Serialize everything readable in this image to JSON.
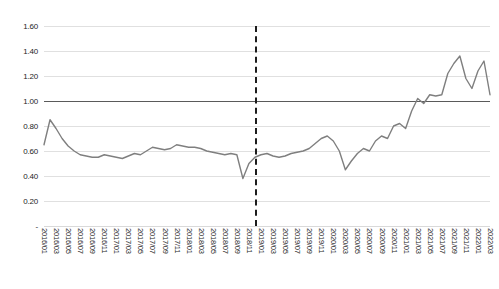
{
  "chart_data": {
    "type": "line",
    "title": "",
    "xlabel": "",
    "ylabel": "",
    "ylim": [
      0,
      1.6
    ],
    "ytick_labels": [
      "1.60",
      "1.40",
      "1.20",
      "1.00",
      "0.80",
      "0.60",
      "0.40",
      "0.20",
      "-"
    ],
    "ytick_values": [
      1.6,
      1.4,
      1.2,
      1.0,
      0.8,
      0.6,
      0.4,
      0.2,
      0.0
    ],
    "grid": "horizontal",
    "legend": "none",
    "reference_line": {
      "value": 1.0,
      "style": "solid",
      "color": "#5a5a5a"
    },
    "annotations": [
      {
        "type": "vertical-dashed-line",
        "x": "2018/12",
        "color": "#1c1c1c"
      }
    ],
    "tick_label_interval_months": 2,
    "tick_labels": [
      "2016/01",
      "2016/03",
      "2016/05",
      "2016/07",
      "2016/09",
      "2016/11",
      "2017/01",
      "2017/03",
      "2017/05",
      "2017/07",
      "2017/09",
      "2017/11",
      "2018/01",
      "2018/03",
      "2018/05",
      "2018/07",
      "2018/09",
      "2018/11",
      "2019/01",
      "2019/03",
      "2019/05",
      "2019/07",
      "2019/09",
      "2019/11",
      "2020/01",
      "2020/03",
      "2020/05",
      "2020/07",
      "2020/09",
      "2020/11",
      "2021/01",
      "2021/03",
      "2021/05",
      "2021/07",
      "2021/09",
      "2021/11",
      "2022/01",
      "2022/03"
    ],
    "x": [
      "2016/01",
      "2016/02",
      "2016/03",
      "2016/04",
      "2016/05",
      "2016/06",
      "2016/07",
      "2016/08",
      "2016/09",
      "2016/10",
      "2016/11",
      "2016/12",
      "2017/01",
      "2017/02",
      "2017/03",
      "2017/04",
      "2017/05",
      "2017/06",
      "2017/07",
      "2017/08",
      "2017/09",
      "2017/10",
      "2017/11",
      "2017/12",
      "2018/01",
      "2018/02",
      "2018/03",
      "2018/04",
      "2018/05",
      "2018/06",
      "2018/07",
      "2018/08",
      "2018/09",
      "2018/10",
      "2018/11",
      "2018/12",
      "2019/01",
      "2019/02",
      "2019/03",
      "2019/04",
      "2019/05",
      "2019/06",
      "2019/07",
      "2019/08",
      "2019/09",
      "2019/10",
      "2019/11",
      "2019/12",
      "2020/01",
      "2020/02",
      "2020/03",
      "2020/04",
      "2020/05",
      "2020/06",
      "2020/07",
      "2020/08",
      "2020/09",
      "2020/10",
      "2020/11",
      "2020/12",
      "2021/01",
      "2021/02",
      "2021/03",
      "2021/04",
      "2021/05",
      "2021/06",
      "2021/07",
      "2021/08",
      "2021/09",
      "2021/10",
      "2021/11",
      "2021/12",
      "2022/01",
      "2022/02",
      "2022/03"
    ],
    "values": [
      0.65,
      0.85,
      0.78,
      0.7,
      0.64,
      0.6,
      0.57,
      0.56,
      0.55,
      0.55,
      0.57,
      0.56,
      0.55,
      0.54,
      0.56,
      0.58,
      0.57,
      0.6,
      0.63,
      0.62,
      0.61,
      0.62,
      0.65,
      0.64,
      0.63,
      0.63,
      0.62,
      0.6,
      0.59,
      0.58,
      0.57,
      0.58,
      0.57,
      0.38,
      0.5,
      0.55,
      0.57,
      0.58,
      0.56,
      0.55,
      0.56,
      0.58,
      0.59,
      0.6,
      0.62,
      0.66,
      0.7,
      0.72,
      0.68,
      0.6,
      0.45,
      0.52,
      0.58,
      0.62,
      0.6,
      0.68,
      0.72,
      0.7,
      0.8,
      0.82,
      0.78,
      0.92,
      1.02,
      0.98,
      1.05,
      1.04,
      1.05,
      1.22,
      1.3,
      1.36,
      1.18,
      1.1,
      1.24,
      1.32,
      1.05
    ],
    "series_color": "#7f7f7f"
  }
}
